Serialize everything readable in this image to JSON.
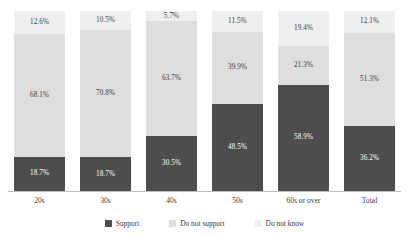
{
  "title_strip": "",
  "chart_data": {
    "type": "bar",
    "subtype": "stacked-100-percent",
    "title": "",
    "subtitle": "",
    "xlabel": "",
    "ylabel": "",
    "ylim": [
      0,
      100
    ],
    "grid": false,
    "legend_position": "bottom-center",
    "orientation": "vertical",
    "stack_order_bottom_to_top": [
      "Support",
      "Do not support",
      "Do not know"
    ],
    "value_suffix": "%",
    "categories": [
      "20s",
      "30s",
      "40s",
      "50s",
      "60s or over",
      "Total"
    ],
    "series": [
      {
        "name": "Support",
        "color": "#4d4d4d",
        "values": [
          18.7,
          18.7,
          30.5,
          48.5,
          58.9,
          36.2
        ],
        "labels": [
          "18.7%",
          "18.7%",
          "30.5%",
          "48.5%",
          "58.9%",
          "36.2%"
        ]
      },
      {
        "name": "Do not support",
        "color": "#dedede",
        "values": [
          68.1,
          70.8,
          63.7,
          39.9,
          21.3,
          51.3
        ],
        "labels": [
          "68.1%",
          "70.8%",
          "63.7%",
          "39.9%",
          "21.3%",
          "51.3%"
        ]
      },
      {
        "name": "Do not know",
        "color": "#efefef",
        "values": [
          12.6,
          10.5,
          5.7,
          11.5,
          19.4,
          12.1
        ],
        "labels": [
          "12.6%",
          "10.5%",
          "5.7%",
          "11.5%",
          "19.4%",
          "12.1%"
        ]
      }
    ]
  },
  "legend": {
    "items": [
      {
        "label": "Support",
        "color": "#4d4d4d"
      },
      {
        "label": "Do not support",
        "color": "#dedede"
      },
      {
        "label": "Do not know",
        "color": "#efefef"
      }
    ]
  }
}
